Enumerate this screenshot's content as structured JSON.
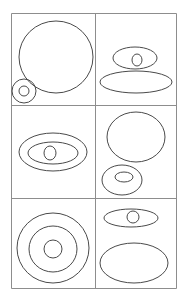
{
  "figure": {
    "canvas": {
      "width": 184,
      "height": 298,
      "background": "#ffffff"
    },
    "grid": {
      "rows": 3,
      "columns": 2,
      "frame": {
        "x": 11,
        "y": 13,
        "width": 165,
        "height": 275
      },
      "line_color": "#8d8d8d",
      "line_width": 1,
      "vertical_dividers_x": [
        95
      ],
      "horizontal_dividers_y": [
        105,
        198
      ]
    },
    "shape_style": {
      "stroke": "#4a4a4a",
      "stroke_width": 1,
      "fill": "none"
    },
    "cells": [
      {
        "id": "cell-top-left",
        "row": 1,
        "column": 1,
        "label": "large circle with small ringed circle",
        "shapes": [
          {
            "name": "large-circle",
            "type": "ellipse",
            "cx": 56,
            "cy": 57,
            "rx": 37,
            "ry": 36
          },
          {
            "name": "small-outer-circle",
            "type": "ellipse",
            "cx": 24,
            "cy": 91,
            "rx": 12,
            "ry": 12
          },
          {
            "name": "small-inner-circle",
            "type": "ellipse",
            "cx": 24,
            "cy": 91,
            "rx": 5,
            "ry": 5
          }
        ]
      },
      {
        "id": "cell-top-right",
        "row": 1,
        "column": 2,
        "label": "ellipse with inner circle above wide flat ellipse",
        "shapes": [
          {
            "name": "upper-ellipse",
            "type": "ellipse",
            "cx": 135,
            "cy": 58,
            "rx": 22,
            "ry": 11
          },
          {
            "name": "upper-ellipse-inner-circle",
            "type": "ellipse",
            "cx": 137,
            "cy": 60,
            "rx": 5,
            "ry": 6
          },
          {
            "name": "lower-wide-ellipse",
            "type": "ellipse",
            "cx": 136,
            "cy": 82,
            "rx": 36,
            "ry": 11
          }
        ]
      },
      {
        "id": "cell-middle-left",
        "row": 2,
        "column": 1,
        "label": "concentric ellipses with center circle",
        "shapes": [
          {
            "name": "outer-ellipse",
            "type": "ellipse",
            "cx": 53,
            "cy": 152,
            "rx": 34,
            "ry": 19
          },
          {
            "name": "inner-ellipse",
            "type": "ellipse",
            "cx": 53,
            "cy": 153,
            "rx": 25,
            "ry": 11
          },
          {
            "name": "center-circle",
            "type": "ellipse",
            "cx": 50,
            "cy": 153,
            "rx": 6,
            "ry": 7
          }
        ]
      },
      {
        "id": "cell-middle-right",
        "row": 2,
        "column": 2,
        "label": "large circle above oval with inner ellipse",
        "shapes": [
          {
            "name": "large-circle",
            "type": "ellipse",
            "cx": 136,
            "cy": 137,
            "rx": 29,
            "ry": 25
          },
          {
            "name": "lower-oval",
            "type": "ellipse",
            "cx": 122,
            "cy": 180,
            "rx": 20,
            "ry": 15
          },
          {
            "name": "lower-oval-inner-ellipse",
            "type": "ellipse",
            "cx": 124,
            "cy": 177,
            "rx": 9,
            "ry": 5
          }
        ]
      },
      {
        "id": "cell-bottom-left",
        "row": 3,
        "column": 1,
        "label": "three concentric circles bullseye",
        "shapes": [
          {
            "name": "outer-ring",
            "type": "ellipse",
            "cx": 53,
            "cy": 248,
            "rx": 36,
            "ry": 35
          },
          {
            "name": "middle-ring",
            "type": "ellipse",
            "cx": 53,
            "cy": 249,
            "rx": 24,
            "ry": 23
          },
          {
            "name": "center-circle",
            "type": "ellipse",
            "cx": 53,
            "cy": 249,
            "rx": 9,
            "ry": 9
          }
        ]
      },
      {
        "id": "cell-bottom-right",
        "row": 3,
        "column": 2,
        "label": "flat ellipse with inner circle above large ellipse",
        "shapes": [
          {
            "name": "upper-flat-ellipse",
            "type": "ellipse",
            "cx": 131,
            "cy": 218,
            "rx": 27,
            "ry": 9
          },
          {
            "name": "upper-ellipse-inner-circle",
            "type": "ellipse",
            "cx": 133,
            "cy": 217,
            "rx": 6,
            "ry": 6
          },
          {
            "name": "lower-large-ellipse",
            "type": "ellipse",
            "cx": 134,
            "cy": 263,
            "rx": 34,
            "ry": 20
          }
        ]
      }
    ]
  }
}
